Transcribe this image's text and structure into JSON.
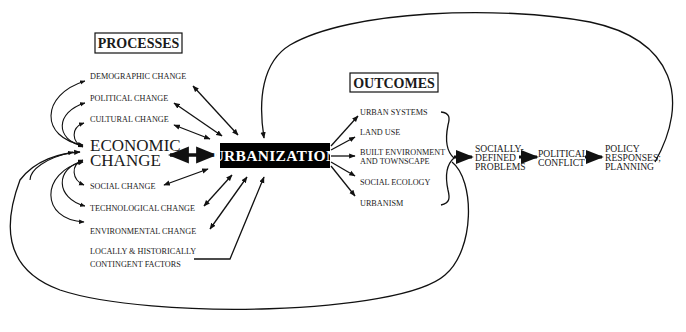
{
  "diagram": {
    "type": "conceptual-flow",
    "colors": {
      "ink": "#111111",
      "central_box_fill": "#000000",
      "central_box_text": "#ffffff",
      "background": "#ffffff"
    },
    "processes": {
      "header": "PROCESSES",
      "items": [
        {
          "id": "demographic",
          "label": "DEMOGRAPHIC CHANGE"
        },
        {
          "id": "political",
          "label": "POLITICAL CHANGE"
        },
        {
          "id": "cultural",
          "label": "CULTURAL CHANGE"
        },
        {
          "id": "economic",
          "label_line1": "ECONOMIC",
          "label_line2": "CHANGE"
        },
        {
          "id": "social",
          "label": "SOCIAL CHANGE"
        },
        {
          "id": "technological",
          "label": "TECHNOLOGICAL CHANGE"
        },
        {
          "id": "environmental",
          "label": "ENVIRONMENTAL CHANGE"
        },
        {
          "id": "contingent",
          "label_line1": "LOCALLY & HISTORICALLY",
          "label_line2": "CONTINGENT FACTORS"
        }
      ]
    },
    "central": {
      "label": "URBANIZATION"
    },
    "outcomes": {
      "header": "OUTCOMES",
      "items": [
        {
          "id": "urban-systems",
          "label": "URBAN SYSTEMS"
        },
        {
          "id": "land-use",
          "label": "LAND USE"
        },
        {
          "id": "built-environment",
          "label_line1": "BUILT ENVIRONMENT",
          "label_line2": "AND TOWNSCAPE"
        },
        {
          "id": "social-ecology",
          "label": "SOCIAL ECOLOGY"
        },
        {
          "id": "urbanism",
          "label": "URBANISM"
        }
      ]
    },
    "chain": [
      {
        "id": "socially-defined-problems",
        "lines": [
          "SOCIALLY-",
          "DEFINED",
          "PROBLEMS"
        ]
      },
      {
        "id": "political-conflict",
        "lines": [
          "POLITICAL",
          "CONFLICT"
        ]
      },
      {
        "id": "policy-responses",
        "lines": [
          "POLICY",
          "RESPONSES;",
          "PLANNING"
        ]
      }
    ],
    "edges": [
      {
        "from": "demographic",
        "to": "urbanization",
        "type": "bidirectional"
      },
      {
        "from": "political",
        "to": "urbanization",
        "type": "bidirectional"
      },
      {
        "from": "cultural",
        "to": "urbanization",
        "type": "bidirectional"
      },
      {
        "from": "economic",
        "to": "urbanization",
        "type": "bidirectional-bold"
      },
      {
        "from": "social",
        "to": "urbanization",
        "type": "bidirectional"
      },
      {
        "from": "technological",
        "to": "urbanization",
        "type": "bidirectional"
      },
      {
        "from": "environmental",
        "to": "urbanization",
        "type": "bidirectional"
      },
      {
        "from": "contingent",
        "to": "urbanization",
        "type": "directed"
      },
      {
        "from": "economic",
        "to": "demographic",
        "type": "curved"
      },
      {
        "from": "economic",
        "to": "political",
        "type": "curved"
      },
      {
        "from": "economic",
        "to": "cultural",
        "type": "curved"
      },
      {
        "from": "economic",
        "to": "social",
        "type": "curved"
      },
      {
        "from": "economic",
        "to": "technological",
        "type": "curved"
      },
      {
        "from": "economic",
        "to": "environmental",
        "type": "curved"
      },
      {
        "from": "urbanization",
        "to": "urban-systems",
        "type": "directed"
      },
      {
        "from": "urbanization",
        "to": "land-use",
        "type": "directed"
      },
      {
        "from": "urbanization",
        "to": "built-environment",
        "type": "directed"
      },
      {
        "from": "urbanization",
        "to": "social-ecology",
        "type": "directed"
      },
      {
        "from": "urbanization",
        "to": "urbanism",
        "type": "directed"
      },
      {
        "from": "outcomes",
        "to": "socially-defined-problems",
        "type": "bold"
      },
      {
        "from": "socially-defined-problems",
        "to": "political-conflict",
        "type": "bold"
      },
      {
        "from": "political-conflict",
        "to": "policy-responses",
        "type": "bold"
      },
      {
        "from": "policy-responses",
        "to": "urbanization",
        "type": "feedback-loop-top"
      },
      {
        "from": "outcomes",
        "to": "economic",
        "type": "feedback-loop-bottom"
      }
    ]
  }
}
